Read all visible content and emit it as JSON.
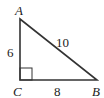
{
  "diagram": {
    "type": "right-triangle",
    "vertices": {
      "A": {
        "label": "A"
      },
      "B": {
        "label": "B"
      },
      "C": {
        "label": "C"
      }
    },
    "sides": {
      "AC": {
        "label": "6"
      },
      "CB": {
        "label": "8"
      },
      "AB": {
        "label": "10"
      }
    },
    "right_angle_at": "C",
    "colors": {
      "stroke": "#333333",
      "text": "#222222"
    }
  }
}
